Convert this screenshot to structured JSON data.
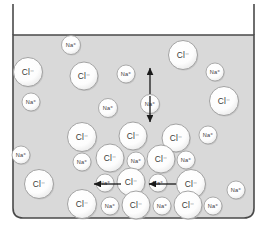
{
  "figure": {
    "container_name": "beaker",
    "solution_fill_color": "#d9d9d9",
    "beaker_outline_color": "#4a4a4a",
    "ion_fill_color": "#ffffff",
    "ion_outline_color": "#9a9a9a",
    "ion_label_color": "#3a3a3a",
    "arrow_color": "#1a1a1a"
  },
  "labels": {
    "chloride": "Cl⁻",
    "sodium": "Na⁺"
  },
  "beaker": {
    "left_wall_x": 13,
    "right_wall_x": 254,
    "top_y": 4,
    "waterline_y": 35,
    "bottom_y": 218,
    "corner_radius": 10
  },
  "ions": [
    {
      "id": "na-1",
      "type": "sodium",
      "label": "Na⁺",
      "cx": 71,
      "cy": 45,
      "r": 9.5
    },
    {
      "id": "cl-1",
      "type": "chloride",
      "label": "Cl⁻",
      "cx": 28,
      "cy": 72,
      "r": 14.5
    },
    {
      "id": "cl-2",
      "type": "chloride",
      "label": "Cl⁻",
      "cx": 84,
      "cy": 76,
      "r": 14.0
    },
    {
      "id": "na-2",
      "type": "sodium",
      "label": "Na⁺",
      "cx": 126,
      "cy": 74,
      "r": 9.0
    },
    {
      "id": "cl-3",
      "type": "chloride",
      "label": "Cl⁻",
      "cx": 183,
      "cy": 55,
      "r": 14.5
    },
    {
      "id": "na-3",
      "type": "sodium",
      "label": "Na⁺",
      "cx": 215,
      "cy": 72,
      "r": 9.0
    },
    {
      "id": "na-4",
      "type": "sodium",
      "label": "Na⁺",
      "cx": 31,
      "cy": 102,
      "r": 9.0
    },
    {
      "id": "na-5",
      "type": "sodium",
      "label": "Na⁺",
      "cx": 108,
      "cy": 108,
      "r": 9.5
    },
    {
      "id": "na-6",
      "type": "sodium",
      "label": "Na⁺",
      "cx": 150,
      "cy": 104,
      "r": 9.5
    },
    {
      "id": "cl-4",
      "type": "chloride",
      "label": "Cl⁻",
      "cx": 224,
      "cy": 101,
      "r": 14.5
    },
    {
      "id": "na-7",
      "type": "sodium",
      "label": "Na⁺",
      "cx": 21,
      "cy": 155,
      "r": 9.0
    },
    {
      "id": "cl-5",
      "type": "chloride",
      "label": "Cl⁻",
      "cx": 82,
      "cy": 137,
      "r": 14.5
    },
    {
      "id": "cl-6",
      "type": "chloride",
      "label": "Cl⁻",
      "cx": 133,
      "cy": 136,
      "r": 14.0
    },
    {
      "id": "cl-7",
      "type": "chloride",
      "label": "Cl⁻",
      "cx": 176,
      "cy": 138,
      "r": 14.0
    },
    {
      "id": "na-8",
      "type": "sodium",
      "label": "Na⁺",
      "cx": 208,
      "cy": 135,
      "r": 9.0
    },
    {
      "id": "na-9",
      "type": "sodium",
      "label": "Na⁺",
      "cx": 82,
      "cy": 162,
      "r": 9.0
    },
    {
      "id": "cl-8",
      "type": "chloride",
      "label": "Cl⁻",
      "cx": 110,
      "cy": 158,
      "r": 14.0
    },
    {
      "id": "na-10",
      "type": "sodium",
      "label": "Na⁺",
      "cx": 136,
      "cy": 161,
      "r": 9.0
    },
    {
      "id": "cl-9",
      "type": "chloride",
      "label": "Cl⁻",
      "cx": 161,
      "cy": 159,
      "r": 14.0
    },
    {
      "id": "na-11",
      "type": "sodium",
      "label": "Na⁺",
      "cx": 186,
      "cy": 160,
      "r": 9.0
    },
    {
      "id": "cl-10",
      "type": "chloride",
      "label": "Cl⁻",
      "cx": 39,
      "cy": 184,
      "r": 14.5
    },
    {
      "id": "na-12",
      "type": "sodium",
      "label": "Na⁺",
      "cx": 105,
      "cy": 183,
      "r": 9.0
    },
    {
      "id": "cl-11",
      "type": "chloride",
      "label": "Cl⁻",
      "cx": 131,
      "cy": 182,
      "r": 14.0
    },
    {
      "id": "na-13",
      "type": "sodium",
      "label": "Na⁺",
      "cx": 158,
      "cy": 183,
      "r": 9.0
    },
    {
      "id": "cl-12",
      "type": "chloride",
      "label": "Cl⁻",
      "cx": 191,
      "cy": 184,
      "r": 14.5
    },
    {
      "id": "na-14",
      "type": "sodium",
      "label": "Na⁺",
      "cx": 236,
      "cy": 190,
      "r": 9.0
    },
    {
      "id": "cl-13",
      "type": "chloride",
      "label": "Cl⁻",
      "cx": 82,
      "cy": 204,
      "r": 14.5
    },
    {
      "id": "na-15",
      "type": "sodium",
      "label": "Na⁺",
      "cx": 110,
      "cy": 206,
      "r": 9.0
    },
    {
      "id": "cl-14",
      "type": "chloride",
      "label": "Cl⁻",
      "cx": 136,
      "cy": 205,
      "r": 14.0
    },
    {
      "id": "na-16",
      "type": "sodium",
      "label": "Na⁺",
      "cx": 162,
      "cy": 206,
      "r": 9.0
    },
    {
      "id": "cl-15",
      "type": "chloride",
      "label": "Cl⁻",
      "cx": 188,
      "cy": 205,
      "r": 14.0
    },
    {
      "id": "na-17",
      "type": "sodium",
      "label": "Na⁺",
      "cx": 213,
      "cy": 206,
      "r": 9.0
    }
  ],
  "arrows": [
    {
      "id": "arrow-up",
      "direction": "up",
      "x1": 150,
      "y1": 94,
      "x2": 150,
      "y2": 68
    },
    {
      "id": "arrow-down",
      "direction": "down",
      "x1": 150,
      "y1": 96,
      "x2": 150,
      "y2": 122
    },
    {
      "id": "arrow-left-1",
      "direction": "left",
      "x1": 121,
      "y1": 184,
      "x2": 94,
      "y2": 184
    },
    {
      "id": "arrow-left-2",
      "direction": "left",
      "x1": 176,
      "y1": 184,
      "x2": 149,
      "y2": 184
    }
  ]
}
